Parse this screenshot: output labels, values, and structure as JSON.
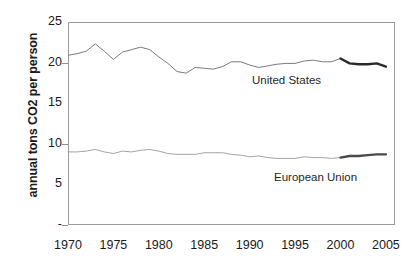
{
  "chart_data": {
    "type": "line",
    "title": "",
    "xlabel": "",
    "ylabel": "annual tons CO2 per person",
    "xlim": [
      1970,
      2006
    ],
    "ylim": [
      0,
      25
    ],
    "grid": false,
    "legend_position": "inline-labels",
    "x_ticks": [
      "1970",
      "1975",
      "1980",
      "1985",
      "1990",
      "1995",
      "2000",
      "2005"
    ],
    "x_tick_values": [
      1970,
      1975,
      1980,
      1985,
      1990,
      1995,
      2000,
      2005
    ],
    "y_ticks": [
      "-",
      "5",
      "10",
      "15",
      "20",
      "25"
    ],
    "y_tick_values": [
      0,
      5,
      10,
      15,
      20,
      25
    ],
    "x": [
      1970,
      1971,
      1972,
      1973,
      1974,
      1975,
      1976,
      1977,
      1978,
      1979,
      1980,
      1981,
      1982,
      1983,
      1984,
      1985,
      1986,
      1987,
      1988,
      1989,
      1990,
      1991,
      1992,
      1993,
      1994,
      1995,
      1996,
      1997,
      1998,
      1999,
      2000,
      2001,
      2002,
      2003,
      2004,
      2005
    ],
    "series": [
      {
        "name": "United States",
        "label": "United States",
        "color": "#6b6b6b",
        "emphasis_color": "#2b2b2b",
        "emphasis_from": 2000,
        "values": [
          20.9,
          21.1,
          21.4,
          22.3,
          21.4,
          20.4,
          21.3,
          21.6,
          21.9,
          21.6,
          20.7,
          19.9,
          18.9,
          18.7,
          19.4,
          19.3,
          19.2,
          19.5,
          20.1,
          20.1,
          19.7,
          19.4,
          19.6,
          19.8,
          19.9,
          19.9,
          20.2,
          20.3,
          20.1,
          20.1,
          20.5,
          19.9,
          19.8,
          19.8,
          19.9,
          19.5
        ]
      },
      {
        "name": "European Union",
        "label": "European Union",
        "color": "#8c8c8c",
        "emphasis_color": "#4a4a4a",
        "emphasis_from": 2000,
        "values": [
          9.0,
          9.0,
          9.1,
          9.3,
          9.0,
          8.8,
          9.1,
          9.0,
          9.2,
          9.3,
          9.1,
          8.8,
          8.7,
          8.7,
          8.7,
          8.9,
          8.9,
          8.9,
          8.7,
          8.6,
          8.4,
          8.5,
          8.3,
          8.2,
          8.2,
          8.2,
          8.4,
          8.3,
          8.3,
          8.2,
          8.3,
          8.5,
          8.5,
          8.6,
          8.7,
          8.7
        ]
      }
    ]
  },
  "axis": {
    "y_title": "annual tons CO2 per person"
  }
}
